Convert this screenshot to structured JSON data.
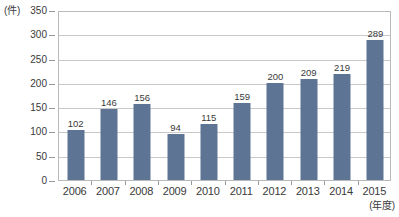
{
  "chart_data": {
    "type": "bar",
    "title": "",
    "subtitle": "",
    "xlabel": "(年度)",
    "ylabel": "(件)",
    "categories": [
      "2006",
      "2007",
      "2008",
      "2009",
      "2010",
      "2011",
      "2012",
      "2013",
      "2014",
      "2015"
    ],
    "values": [
      102,
      146,
      156,
      94,
      115,
      159,
      200,
      209,
      219,
      289
    ],
    "series": [
      {
        "name": "件数",
        "values": [
          102,
          146,
          156,
          94,
          115,
          159,
          200,
          209,
          219,
          289
        ]
      }
    ],
    "data_labels": [
      "102",
      "146",
      "156",
      "94",
      "115",
      "159",
      "200",
      "209",
      "219",
      "289"
    ],
    "ylim": [
      0,
      350
    ],
    "ytick_step": 50,
    "ytick_labels": [
      "0",
      "50",
      "100",
      "150",
      "200",
      "250",
      "300",
      "350"
    ],
    "ytick_values": [
      0,
      50,
      100,
      150,
      200,
      250,
      300,
      350
    ],
    "grid": true,
    "grid_axis": "y",
    "legend": false,
    "legend_position": "none",
    "bar_color": "#5e7494",
    "grid_color": "#c9c9c9",
    "axis_color": "#b9b9b9",
    "text_color": "#3a3a3a",
    "background_color": "#ffffff"
  }
}
